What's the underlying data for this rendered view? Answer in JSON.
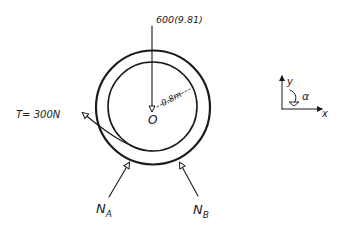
{
  "diagram": {
    "type": "free-body-diagram",
    "body": {
      "shape": "circular-ring",
      "center_label": "O",
      "radius_label": "0.8m"
    },
    "forces": [
      {
        "id": "weight",
        "label": "600(9.81)",
        "direction": "down",
        "applied_at": "O"
      },
      {
        "id": "tension",
        "label": "T= 300N",
        "direction": "up-left",
        "applied_at": "rim-bottom"
      },
      {
        "id": "normal-a",
        "label": "N",
        "subscript": "A",
        "direction": "up-right",
        "applied_at": "bottom-left-contact"
      },
      {
        "id": "normal-b",
        "label": "N",
        "subscript": "B",
        "direction": "up-left",
        "applied_at": "bottom-right-contact"
      }
    ],
    "axes": {
      "x_label": "x",
      "y_label": "y",
      "angular_label": "α",
      "angular_direction": "clockwise"
    }
  },
  "colors": {
    "ink": "#1a1a1a",
    "background": "#ffffff"
  }
}
